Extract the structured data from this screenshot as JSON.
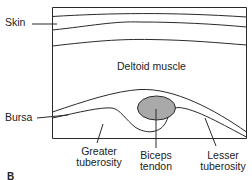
{
  "diagram": {
    "panel_letter": "B",
    "colors": {
      "line": "#2a2a2a",
      "tendon_fill": "#a9a9a9",
      "background": "#ffffff"
    },
    "labels": {
      "skin": "Skin",
      "deltoid": "Deltoid muscle",
      "bursa": "Bursa",
      "greater_tuberosity_line1": "Greater",
      "greater_tuberosity_line2": "tuberosity",
      "biceps_tendon_line1": "Biceps",
      "biceps_tendon_line2": "tendon",
      "lesser_tuberosity_line1": "Lesser",
      "lesser_tuberosity_line2": "tuberosity"
    },
    "structures": [
      {
        "name": "Skin",
        "type": "layer"
      },
      {
        "name": "Deltoid muscle",
        "type": "region"
      },
      {
        "name": "Bursa",
        "type": "layer"
      },
      {
        "name": "Greater tuberosity",
        "type": "bone"
      },
      {
        "name": "Biceps tendon",
        "type": "tendon"
      },
      {
        "name": "Lesser tuberosity",
        "type": "bone"
      }
    ]
  }
}
